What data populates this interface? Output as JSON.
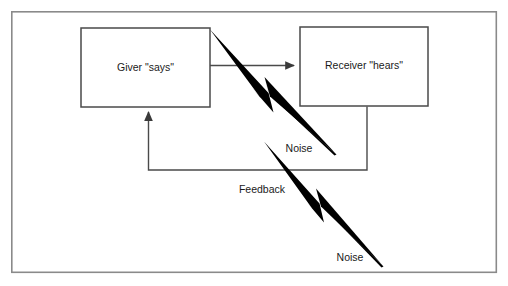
{
  "diagram": {
    "background_color": "#ffffff",
    "frame": {
      "name": "outer-frame",
      "x": 11,
      "y": 11,
      "width": 486,
      "height": 262,
      "stroke_color": "#8a8a8a",
      "stroke_width": 1.6
    },
    "nodes": [
      {
        "id": "giver",
        "label": "Giver \"says\"",
        "x": 81,
        "y": 28,
        "width": 129,
        "height": 79,
        "stroke_color": "#4a4a4a",
        "fill_color": "#ffffff",
        "stroke_width": 1.5
      },
      {
        "id": "receiver",
        "label": "Receiver \"hears\"",
        "x": 300,
        "y": 27,
        "width": 128,
        "height": 79,
        "stroke_color": "#4a4a4a",
        "fill_color": "#ffffff",
        "stroke_width": 1.5
      }
    ],
    "edges": [
      {
        "id": "message",
        "label": "",
        "from": "giver",
        "to": "receiver",
        "arrowhead": "triangle",
        "stroke_color": "#4a4a4a",
        "stroke_width": 1.4
      },
      {
        "id": "feedback",
        "label": "Feedback",
        "from": "receiver",
        "to": "giver",
        "arrowhead": "triangle",
        "stroke_color": "#4a4a4a",
        "stroke_width": 1.4,
        "label_x": 262,
        "label_y": 190
      }
    ],
    "noise_bolts": [
      {
        "id": "noise-upper",
        "label": "Noise",
        "label_x": 299,
        "label_y": 149,
        "start_x": 210,
        "start_y": 30,
        "end_x": 336,
        "end_y": 154,
        "fill_color": "#000000"
      },
      {
        "id": "noise-lower",
        "label": "Noise",
        "label_x": 350,
        "label_y": 258,
        "start_x": 264,
        "start_y": 142,
        "end_x": 383,
        "end_y": 266,
        "fill_color": "#000000"
      }
    ]
  }
}
